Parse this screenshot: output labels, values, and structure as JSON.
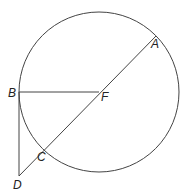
{
  "diagram": {
    "type": "geometry",
    "circle": {
      "center": "F",
      "cx": 99,
      "cy": 92,
      "r": 80
    },
    "points": {
      "A": {
        "label": "A",
        "x": 156,
        "y": 36
      },
      "B": {
        "label": "B",
        "x": 19,
        "y": 92
      },
      "C": {
        "label": "C",
        "x": 42,
        "y": 148
      },
      "D": {
        "label": "D",
        "x": 19,
        "y": 176
      },
      "F": {
        "label": "F",
        "x": 99,
        "y": 92
      }
    },
    "segments": [
      {
        "from": "B",
        "to": "F"
      },
      {
        "from": "A",
        "to": "D"
      },
      {
        "from": "B",
        "to": "D"
      }
    ],
    "stroke_color": "#444444"
  }
}
